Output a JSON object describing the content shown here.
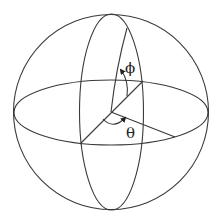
{
  "diagram": {
    "colors": {
      "stroke": "#3a3a3a",
      "text": "#222222",
      "background": "#ffffff"
    },
    "labels": {
      "phi": "ϕ",
      "theta": "θ"
    },
    "shapes": {
      "sphere_outline": {
        "cx": 111,
        "cy": 112,
        "r": 97.5
      },
      "meridian_ellipse": {
        "cx": 111.5,
        "cy": 112,
        "rx": 32,
        "ry": 98
      },
      "equator_ellipse": {
        "cx": 111,
        "cy": 112.5,
        "rx": 97,
        "ry": 32.5
      },
      "origin": {
        "x": 111,
        "y": 112
      }
    }
  }
}
